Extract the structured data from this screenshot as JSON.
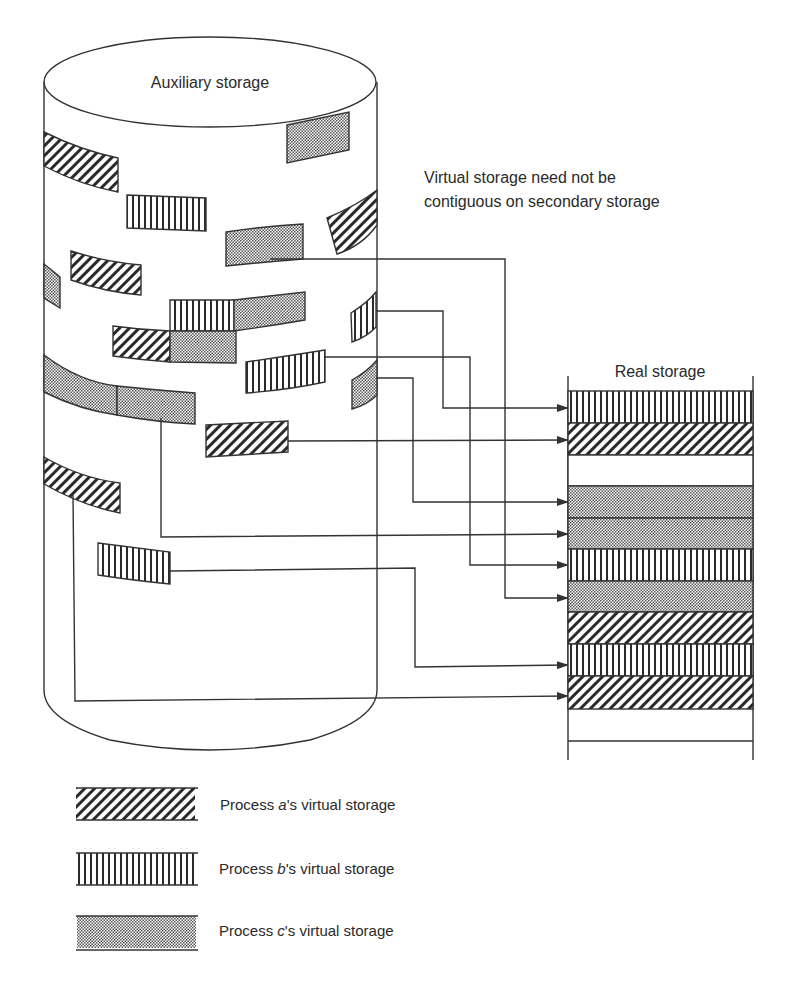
{
  "diagram": {
    "type": "virtual-to-real-storage-mapping",
    "auxiliary_storage": {
      "label": "Auxiliary storage",
      "shape": "cylinder"
    },
    "annotation": {
      "line1": "Virtual storage need not be",
      "line2": "contiguous on secondary storage"
    },
    "real_storage": {
      "label": "Real storage",
      "rows": [
        "b",
        "a",
        "empty",
        "c",
        "c",
        "b",
        "c",
        "a",
        "b",
        "a",
        "empty"
      ]
    },
    "legend": [
      {
        "pattern": "diagonal-hatch",
        "process": "a",
        "prefix": "Process ",
        "italic": "a",
        "suffix": "'s virtual storage"
      },
      {
        "pattern": "vertical-stripes",
        "process": "b",
        "prefix": "Process ",
        "italic": "b",
        "suffix": "'s virtual storage"
      },
      {
        "pattern": "dotted-fill",
        "process": "c",
        "prefix": "Process ",
        "italic": "c",
        "suffix": "'s virtual storage"
      }
    ],
    "colors": {
      "ink": "#333333",
      "background": "#ffffff"
    }
  }
}
